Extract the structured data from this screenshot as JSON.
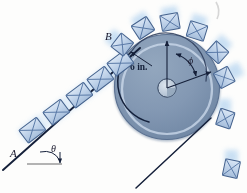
{
  "figure": {
    "labels": {
      "point_a": "A",
      "point_b": "B",
      "incline_angle": "θ",
      "drum_angle": "ϕ",
      "radius_dimension": "6 in."
    },
    "colors": {
      "background": "#fdfdfc",
      "drum_fill": "#7e93ae",
      "drum_fill_light": "#92a6bd",
      "drum_edge": "#4c617d",
      "drum_inner_arc": "#13203b",
      "drum_highlight_ring": "#cfdced",
      "hub_fill": "#b9c7d6",
      "hub_edge": "#33445f",
      "package_fill": "#b9cde6",
      "package_fill_light": "#d5e3f3",
      "package_edge": "#44618c",
      "package_cross": "#5878a6",
      "motion_blur": "#bcd8ef",
      "belt_line": "#15203a",
      "ground_line": "#6b6b6b",
      "label_text": "#1a1a2e",
      "scan_mark": "#c9c9c9"
    },
    "geometry": {
      "drum_center_x": 167,
      "drum_center_y": 87,
      "drum_outer_radius": 53,
      "drum_inner_arc_radius": 41,
      "hub_radius": 9,
      "incline_angle_degrees": 37
    },
    "packages_on_incline": [
      {
        "x": 33,
        "y": 131,
        "rotation": -37
      },
      {
        "x": 57,
        "y": 113,
        "rotation": -37
      },
      {
        "x": 80,
        "y": 96,
        "rotation": -37
      },
      {
        "x": 100,
        "y": 80,
        "rotation": -37
      },
      {
        "x": 120,
        "y": 64,
        "rotation": -37
      }
    ],
    "packages_on_drum": [
      {
        "x": 122,
        "y": 45,
        "rotation": -52
      },
      {
        "x": 143,
        "y": 28,
        "rotation": -33
      },
      {
        "x": 170,
        "y": 22,
        "rotation": -10
      },
      {
        "x": 197,
        "y": 31,
        "rotation": 17
      },
      {
        "x": 217,
        "y": 52,
        "rotation": 42
      },
      {
        "x": 224,
        "y": 77,
        "rotation": 62
      }
    ],
    "packages_falling": [
      {
        "x": 225,
        "y": 118,
        "rotation": 18
      },
      {
        "x": 231,
        "y": 168,
        "rotation": 12
      }
    ]
  }
}
